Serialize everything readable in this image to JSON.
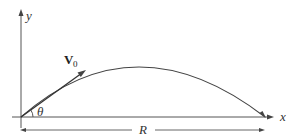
{
  "diagram": {
    "labels": {
      "y_axis": "y",
      "x_axis": "x",
      "velocity_main": "V",
      "velocity_sub": "0",
      "angle": "θ",
      "range": "R"
    },
    "colors": {
      "axis": "#555555",
      "trajectory": "#444444",
      "vector": "#333333",
      "text": "#333333"
    }
  }
}
